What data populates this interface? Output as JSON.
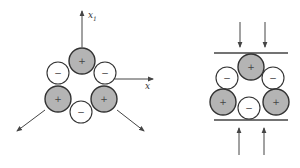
{
  "colors": {
    "positive_fill": "#b4b4b4",
    "negative_fill": "#ffffff",
    "outline": "#333333",
    "line": "#444444",
    "background": "#ffffff"
  },
  "left_diagram": {
    "description": "Ring of six charged ions with outward strain arrows",
    "axis_vertical": {
      "label": "x",
      "subscript": "1",
      "x": 82,
      "y1": 47,
      "y2": 11
    },
    "axis_horizontal": {
      "label": "x",
      "y": 79,
      "x1": 115,
      "x2": 153
    },
    "ions": [
      {
        "sign": "+",
        "type": "positive",
        "cx": 82,
        "cy": 61,
        "r": 13
      },
      {
        "sign": "−",
        "type": "negative",
        "cx": 58,
        "cy": 73,
        "r": 11
      },
      {
        "sign": "−",
        "type": "negative",
        "cx": 105,
        "cy": 73,
        "r": 11
      },
      {
        "sign": "+",
        "type": "positive",
        "cx": 58,
        "cy": 99,
        "r": 13
      },
      {
        "sign": "−",
        "type": "negative",
        "cx": 81,
        "cy": 112,
        "r": 11
      },
      {
        "sign": "+",
        "type": "positive",
        "cx": 104,
        "cy": 99,
        "r": 13
      }
    ],
    "arrows": [
      {
        "name": "arrow-down-left",
        "x1": 45,
        "y1": 110,
        "x2": 17,
        "y2": 131
      },
      {
        "name": "arrow-down-right",
        "x1": 117,
        "y1": 110,
        "x2": 144,
        "y2": 131
      }
    ]
  },
  "right_diagram": {
    "description": "Ring of six charged ions compressed between two plates",
    "plates": [
      {
        "name": "top-plate",
        "y": 53,
        "x1": 214,
        "x2": 288
      },
      {
        "name": "bottom-plate",
        "y": 120,
        "x1": 214,
        "x2": 288
      }
    ],
    "ions": [
      {
        "sign": "+",
        "type": "positive",
        "cx": 251,
        "cy": 67,
        "r": 13
      },
      {
        "sign": "−",
        "type": "negative",
        "cx": 227,
        "cy": 78,
        "r": 11
      },
      {
        "sign": "−",
        "type": "negative",
        "cx": 273,
        "cy": 78,
        "r": 11
      },
      {
        "sign": "+",
        "type": "positive",
        "cx": 223,
        "cy": 102,
        "r": 13
      },
      {
        "sign": "−",
        "type": "negative",
        "cx": 249,
        "cy": 108,
        "r": 11
      },
      {
        "sign": "+",
        "type": "positive",
        "cx": 276,
        "cy": 102,
        "r": 13
      }
    ],
    "arrows": [
      {
        "name": "arrow-down-top-left",
        "x1": 240,
        "y1": 22,
        "x2": 240,
        "y2": 47
      },
      {
        "name": "arrow-down-top-right",
        "x1": 265,
        "y1": 22,
        "x2": 265,
        "y2": 47
      },
      {
        "name": "arrow-up-bottom-left",
        "x1": 239,
        "y1": 155,
        "x2": 239,
        "y2": 128
      },
      {
        "name": "arrow-up-bottom-right",
        "x1": 264,
        "y1": 155,
        "x2": 264,
        "y2": 128
      }
    ]
  }
}
